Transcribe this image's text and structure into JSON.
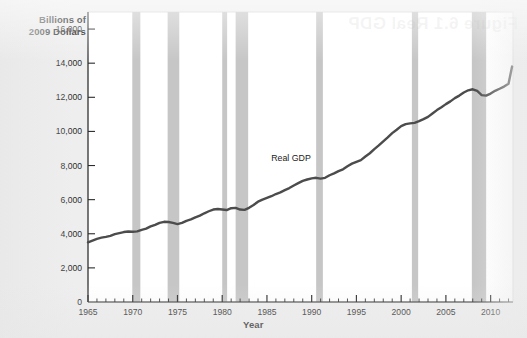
{
  "figure": {
    "background_color": "#eeeeee",
    "plot_background_color": "#ffffff",
    "watermark_text": "Figure 6.1 Real GDP"
  },
  "chart_data": {
    "type": "line",
    "title": "",
    "xlabel": "Year",
    "ylabel": "Billions of 2009 Dollars",
    "ylabel_line1": "Billions of",
    "ylabel_line2": "2009 Dollars",
    "series_annotation": "Real GDP",
    "grid": false,
    "legend_position": "none",
    "line_color": "#4c4c4c",
    "recession_band_color": "#c6c6c6",
    "xlim": [
      1965,
      2012.5
    ],
    "ylim": [
      0,
      17000
    ],
    "xticks": [
      1965,
      1970,
      1975,
      1980,
      1985,
      1990,
      1995,
      2000,
      2005,
      2010
    ],
    "xtick_labels": [
      "1965",
      "1970",
      "1975",
      "1980",
      "1985",
      "1990",
      "1995",
      "2000",
      "2005",
      "2010"
    ],
    "xminor_tick_interval": 1,
    "yticks": [
      0,
      2000,
      4000,
      6000,
      8000,
      10000,
      12000,
      14000,
      16000
    ],
    "ytick_labels": [
      "0",
      "2,000",
      "4,000",
      "6,000",
      "8,000",
      "10,000",
      "12,000",
      "14,000",
      "16,000"
    ],
    "series": [
      {
        "name": "Real GDP",
        "x": [
          1965,
          1965.5,
          1966,
          1966.5,
          1967,
          1967.5,
          1968,
          1968.5,
          1969,
          1969.5,
          1970,
          1970.5,
          1971,
          1971.5,
          1972,
          1972.5,
          1973,
          1973.5,
          1974,
          1974.5,
          1975,
          1975.5,
          1976,
          1976.5,
          1977,
          1977.5,
          1978,
          1978.5,
          1979,
          1979.5,
          1980,
          1980.5,
          1981,
          1981.5,
          1982,
          1982.5,
          1983,
          1983.5,
          1984,
          1984.5,
          1985,
          1985.5,
          1986,
          1986.5,
          1987,
          1987.5,
          1988,
          1988.5,
          1989,
          1989.5,
          1990,
          1990.5,
          1991,
          1991.5,
          1992,
          1992.5,
          1993,
          1993.5,
          1994,
          1994.5,
          1995,
          1995.5,
          1996,
          1996.5,
          1997,
          1997.5,
          1998,
          1998.5,
          1999,
          1999.5,
          2000,
          2000.5,
          2001,
          2001.5,
          2002,
          2002.5,
          2003,
          2003.5,
          2004,
          2004.5,
          2005,
          2005.5,
          2006,
          2006.5,
          2007,
          2007.5,
          2008,
          2008.5,
          2009,
          2009.5,
          2010,
          2010.5,
          2011,
          2011.5,
          2012,
          2012.4
        ],
        "y": [
          3500,
          3600,
          3700,
          3770,
          3820,
          3880,
          3980,
          4040,
          4100,
          4130,
          4120,
          4140,
          4230,
          4300,
          4430,
          4520,
          4640,
          4700,
          4690,
          4640,
          4570,
          4640,
          4760,
          4840,
          4960,
          5060,
          5200,
          5320,
          5420,
          5450,
          5420,
          5390,
          5500,
          5520,
          5420,
          5400,
          5520,
          5690,
          5880,
          6000,
          6100,
          6200,
          6330,
          6430,
          6560,
          6680,
          6830,
          6970,
          7100,
          7180,
          7250,
          7280,
          7230,
          7280,
          7430,
          7540,
          7670,
          7780,
          7960,
          8110,
          8220,
          8320,
          8530,
          8720,
          8960,
          9180,
          9420,
          9650,
          9900,
          10100,
          10310,
          10430,
          10470,
          10500,
          10600,
          10720,
          10850,
          11050,
          11250,
          11420,
          11600,
          11760,
          11950,
          12100,
          12280,
          12410,
          12470,
          12380,
          12130,
          12100,
          12220,
          12380,
          12500,
          12630,
          12800,
          13800
        ],
        "units": "billions of chained 2009 dollars",
        "start_value": 3500,
        "end_value": 13800
      }
    ],
    "recession_bands": [
      {
        "start": 1969.95,
        "end": 1970.85,
        "label": "1969-70 recession"
      },
      {
        "start": 1973.9,
        "end": 1975.2,
        "label": "1973-75 recession"
      },
      {
        "start": 1980.0,
        "end": 1980.55,
        "label": "1980 recession"
      },
      {
        "start": 1981.5,
        "end": 1982.9,
        "label": "1981-82 recession"
      },
      {
        "start": 1990.5,
        "end": 1991.25,
        "label": "1990-91 recession"
      },
      {
        "start": 2001.2,
        "end": 2001.9,
        "label": "2001 recession"
      },
      {
        "start": 2007.9,
        "end": 2009.5,
        "label": "2007-09 recession"
      }
    ]
  }
}
